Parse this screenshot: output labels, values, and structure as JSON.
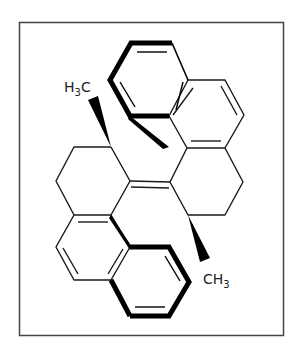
{
  "diagram": {
    "type": "chemical-structure",
    "labels": {
      "top_methyl": {
        "main": "H",
        "sub": "3",
        "tail": "C"
      },
      "bottom_methyl": {
        "main": "CH",
        "sub": "3"
      }
    },
    "colors": {
      "line": "#1a1a1a",
      "frame": "#444444",
      "background": "#ffffff"
    }
  }
}
